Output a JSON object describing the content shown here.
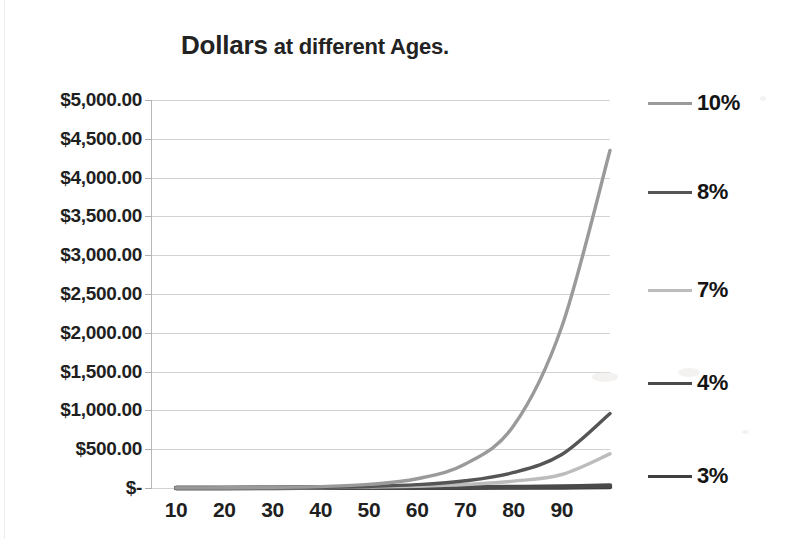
{
  "chart_data": {
    "type": "line",
    "title": "Dollars at different Ages.",
    "title_main": "Dollars",
    "title_rest": " at different Ages.",
    "xlabel": "",
    "ylabel": "",
    "x": [
      10,
      20,
      30,
      40,
      50,
      60,
      70,
      80,
      90,
      100
    ],
    "xtick_labels": [
      "10",
      "20",
      "30",
      "40",
      "50",
      "60",
      "70",
      "80",
      "90"
    ],
    "xlim": [
      5,
      100
    ],
    "ylim": [
      0,
      5000
    ],
    "ytick_labels": [
      "$5,000.00",
      "$4,500.00",
      "$4,000.00",
      "$3,500.00",
      "$3,000.00",
      "$2,500.00",
      "$2,000.00",
      "$1,500.00",
      "$1,000.00",
      "$500.00",
      "$-"
    ],
    "ytick_values": [
      5000,
      4500,
      4000,
      3500,
      3000,
      2500,
      2000,
      1500,
      1000,
      500,
      0
    ],
    "grid": true,
    "legend_position": "right",
    "series": [
      {
        "name": "10%",
        "color": "#9a9a9a",
        "legend_y": 103,
        "values": [
          1,
          3,
          7,
          18,
          46,
          119,
          309,
          801,
          2078,
          4350
        ]
      },
      {
        "name": "8%",
        "color": "#555555",
        "legend_y": 192,
        "values": [
          1,
          2,
          4,
          9,
          20,
          43,
          93,
          200,
          432,
          960
        ]
      },
      {
        "name": "7%",
        "color": "#bcbcbc",
        "legend_y": 290,
        "values": [
          1,
          2,
          3,
          6,
          12,
          23,
          45,
          88,
          174,
          440
        ]
      },
      {
        "name": "4%",
        "color": "#4a4a4a",
        "legend_y": 383,
        "values": [
          1,
          1,
          2,
          3,
          4,
          6,
          9,
          13,
          19,
          32
        ]
      },
      {
        "name": "3%",
        "color": "#3f3f3f",
        "legend_y": 476,
        "values": [
          1,
          1,
          1,
          2,
          2,
          3,
          4,
          6,
          8,
          13
        ]
      }
    ]
  }
}
